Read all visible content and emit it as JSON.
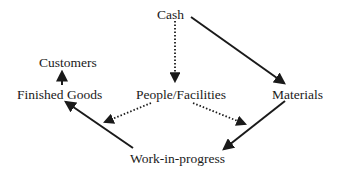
{
  "diagram": {
    "nodes": {
      "cash": {
        "label": "Cash"
      },
      "customers": {
        "label": "Customers"
      },
      "finished_goods": {
        "label": "Finished Goods"
      },
      "people_facilities": {
        "label": "People/Facilities"
      },
      "materials": {
        "label": "Materials"
      },
      "work_in_progress": {
        "label": "Work-in-progress"
      }
    },
    "edges": [
      {
        "from": "Cash",
        "to": "Materials",
        "style": "solid"
      },
      {
        "from": "Cash",
        "to": "People/Facilities",
        "style": "dotted"
      },
      {
        "from": "People/Facilities",
        "to": "Finished Goods (WIP→FG arrow)",
        "style": "dotted"
      },
      {
        "from": "People/Facilities",
        "to": "Work-in-progress (Materials→WIP arrow)",
        "style": "dotted"
      },
      {
        "from": "Materials",
        "to": "Work-in-progress",
        "style": "solid"
      },
      {
        "from": "Work-in-progress",
        "to": "Finished Goods",
        "style": "solid"
      },
      {
        "from": "Finished Goods",
        "to": "Customers",
        "style": "solid"
      }
    ],
    "colors": {
      "ink": "#1a1a1a",
      "background": "#ffffff"
    }
  }
}
